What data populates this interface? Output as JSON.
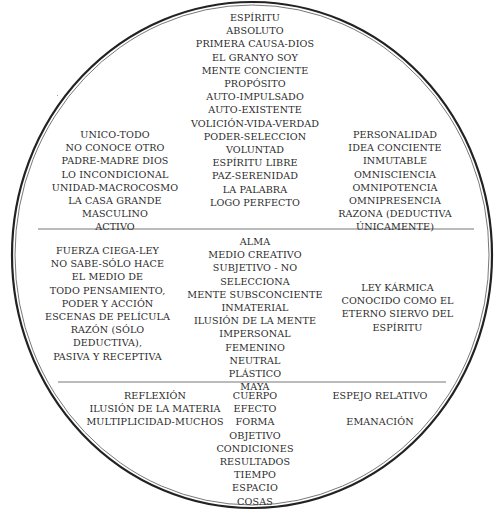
{
  "diagram": {
    "shape": "circle-divided-in-three-bands",
    "colors": {
      "line": "#222222",
      "divider": "#777777",
      "text": "#2a2a2a",
      "background": "#ffffff"
    },
    "top_section": {
      "center": [
        "ESPÍRITU",
        "ABSOLUTO",
        "PRIMERA CAUSA-DIOS",
        "EL GRANYO SOY",
        "MENTE CONCIENTE",
        "PROPÓSITO",
        "AUTO-IMPULSADO",
        "AUTO-EXISTENTE",
        "VOLICIÓN-VIDA-VERDAD",
        "PODER-SELECCION",
        "VOLUNTAD",
        "ESPÍRITU LIBRE",
        "PAZ-SERENIDAD",
        "LA PALABRA",
        "LOGO PERFECTO"
      ],
      "left": [
        "UNICO-TODO",
        "NO CONOCE OTRO",
        "PADRE-MADRE DIOS",
        "LO INCONDICIONAL",
        "UNIDAD-MACROCOSMO",
        "LA CASA GRANDE",
        "MASCULINO",
        "ACTIVO"
      ],
      "right": [
        "PERSONALIDAD",
        "IDEA CONCIENTE",
        "INMUTABLE",
        "OMNISCIENCIA",
        "OMNIPOTENCIA",
        "OMNIPRESENCIA",
        "RAZONA (DEDUCTIVA",
        "ÚNICAMENTE)"
      ]
    },
    "middle_section": {
      "center": [
        "ALMA",
        "MEDIO CREATIVO",
        "SUBJETIVO - NO",
        "SELECCIONA",
        "MENTE SUBSCONCIENTE",
        "INMATERIAL",
        "ILUSIÓN DE LA MENTE",
        "IMPERSONAL",
        "FEMENINO",
        "NEUTRAL",
        "PLÁSTICO",
        "MAYA"
      ],
      "left": [
        "FUERZA CIEGA-LEY",
        "NO SABE-SÓLO HACE",
        "EL MEDIO DE",
        "TODO PENSAMIENTO,",
        "PODER Y ACCIÓN",
        "ESCENAS DE PELÍCULA",
        "RAZÓN (SÓLO",
        "DEDUCTIVA),",
        "PASIVA Y RECEPTIVA"
      ],
      "right": [
        "LEY KÁRMICA",
        "CONOCIDO COMO EL",
        "ETERNO SIERVO DEL",
        "ESPÍRITU"
      ]
    },
    "bottom_section": {
      "center": [
        "CUERPO",
        "EFECTO",
        "FORMA",
        "OBJETIVO",
        "CONDICIONES",
        "RESULTADOS",
        "TIEMPO",
        "ESPACIO",
        "COSAS"
      ],
      "left": [
        "REFLEXIÓN",
        "ILUSIÓN DE LA MATERIA",
        "MULTIPLICIDAD-MUCHOS"
      ],
      "right": [
        "ESPEJO RELATIVO",
        "",
        "EMANACIÓN"
      ]
    }
  }
}
